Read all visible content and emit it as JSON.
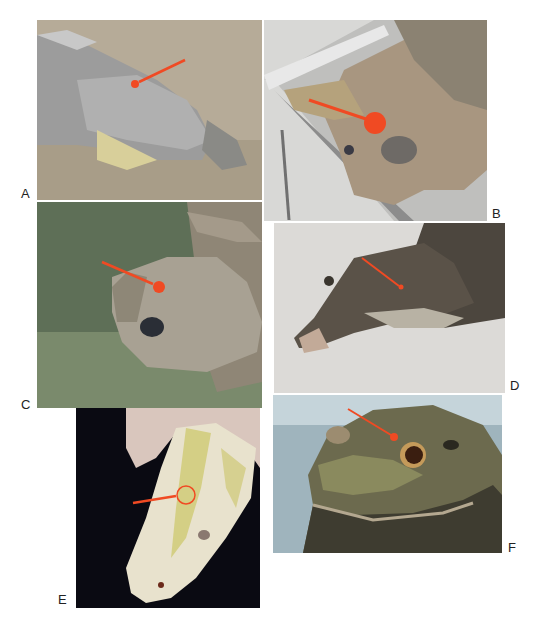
{
  "figure": {
    "panels": [
      {
        "id": "A",
        "label": "A",
        "subject": "alligator head on sandy ground",
        "marker": "arrow-to-dot",
        "accent": "#f04a23"
      },
      {
        "id": "B",
        "label": "B",
        "subject": "sea turtle head on steel tray",
        "marker": "arrow-to-large-dot",
        "accent": "#f04a23"
      },
      {
        "id": "C",
        "label": "C",
        "subject": "tortoise head on grass",
        "marker": "arrow-to-dot",
        "accent": "#f04a23"
      },
      {
        "id": "D",
        "label": "D",
        "subject": "monitor lizard head on white background",
        "marker": "arrow",
        "accent": "#f04a23"
      },
      {
        "id": "E",
        "label": "E",
        "subject": "albino python head held in hand",
        "marker": "arrow-to-circle",
        "accent": "#f04a23"
      },
      {
        "id": "F",
        "label": "F",
        "subject": "bullfrog head close-up",
        "marker": "arrow-to-dot",
        "accent": "#f04a23"
      }
    ],
    "accent_color": "#f04a23"
  }
}
